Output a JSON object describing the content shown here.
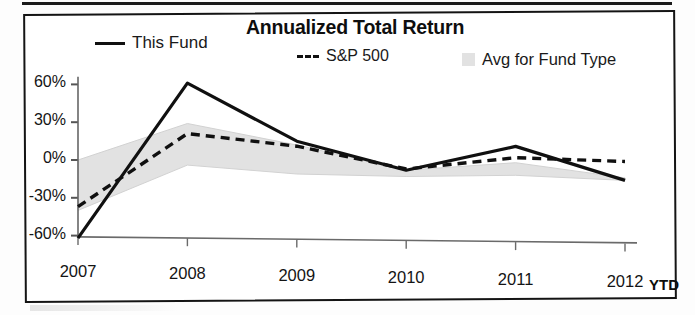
{
  "chart_data": {
    "type": "line",
    "title": "Annualized Total Return",
    "xlabel": "",
    "ylabel": "",
    "x": [
      "2007",
      "2008",
      "2009",
      "2010",
      "2011",
      "2012"
    ],
    "categories": [
      "2007",
      "2008",
      "2009",
      "2010",
      "2011",
      "2012"
    ],
    "x_last_suffix": "YTD",
    "ylim": [
      -60,
      60
    ],
    "yticks": [
      60,
      30,
      0,
      -30,
      -60
    ],
    "ytick_labels": [
      "60%",
      "30%",
      "0%",
      "-30%",
      "-60%"
    ],
    "grid": false,
    "legend_position": "top",
    "series": [
      {
        "name": "This Fund",
        "style": "solid",
        "color": "#101010",
        "values": [
          -62,
          62,
          17,
          -5,
          15,
          -11
        ]
      },
      {
        "name": "S&P 500",
        "style": "dashed",
        "color": "#101010",
        "values": [
          -37,
          22,
          13,
          -4,
          6,
          4
        ]
      },
      {
        "name": "Avg for Fund Type",
        "style": "band",
        "color": "#e2e2e2",
        "upper": [
          0,
          30,
          14,
          -5,
          2,
          -9
        ],
        "lower": [
          -40,
          -3,
          -9,
          -10,
          -8,
          -11
        ]
      }
    ]
  },
  "legend": [
    {
      "label": "This Fund",
      "swatch": "solid-line-swatch"
    },
    {
      "label": "S&P 500",
      "swatch": "dashed-line-swatch"
    },
    {
      "label": "Avg for Fund Type",
      "swatch": "gray-box-swatch"
    }
  ],
  "axis": {
    "y_labels": [
      "60%",
      "30%",
      "0%",
      "-30%",
      "-60%"
    ],
    "x_labels": [
      "2007",
      "2008",
      "2009",
      "2010",
      "2011",
      "2012"
    ],
    "ytd_label": "YTD"
  },
  "colors": {
    "line": "#101010",
    "band": "#e2e2e2",
    "axis": "#5a5a5a",
    "frame": "#141414"
  }
}
